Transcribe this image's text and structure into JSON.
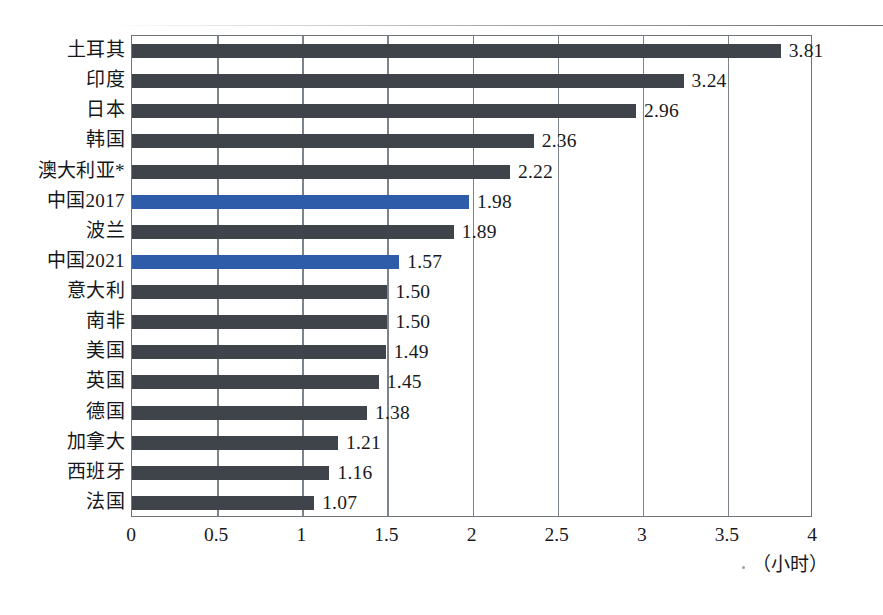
{
  "chart_data": {
    "type": "bar",
    "orientation": "horizontal",
    "title": "",
    "subtitle": "",
    "xlabel": "（小时）",
    "ylabel": "",
    "xlim": [
      0,
      4
    ],
    "xticks": [
      "0",
      "0.5",
      "1",
      "1.5",
      "2",
      "2.5",
      "3",
      "3.5",
      "4"
    ],
    "xtick_values": [
      0,
      0.5,
      1,
      1.5,
      2,
      2.5,
      3,
      3.5,
      4
    ],
    "grid": true,
    "grid_axis": "x",
    "legend": "none",
    "categories": [
      "土耳其",
      "印度",
      "日本",
      "韩国",
      "澳大利亚*",
      "中国2017",
      "波兰",
      "中国2021",
      "意大利",
      "南非",
      "美国",
      "英国",
      "德国",
      "加拿大",
      "西班牙",
      "法国"
    ],
    "values": [
      3.81,
      3.24,
      2.96,
      2.36,
      2.22,
      1.98,
      1.89,
      1.57,
      1.5,
      1.5,
      1.49,
      1.45,
      1.38,
      1.21,
      1.16,
      1.07
    ],
    "value_labels": [
      "3.81",
      "3.24",
      "2.96",
      "2.36",
      "2.22",
      "1.98",
      "1.89",
      "1.57",
      "1.50",
      "1.50",
      "1.49",
      "1.45",
      "1.38",
      "1.21",
      "1.16",
      "1.07"
    ],
    "highlighted": [
      false,
      false,
      false,
      false,
      false,
      true,
      false,
      true,
      false,
      false,
      false,
      false,
      false,
      false,
      false,
      false
    ],
    "colors": {
      "bar": "#3f444a",
      "bar_highlight": "#2e5ca8",
      "axis": "#6f757b",
      "gridline": "#7d838a",
      "text": "#17191c",
      "background": "#ffffff"
    }
  }
}
